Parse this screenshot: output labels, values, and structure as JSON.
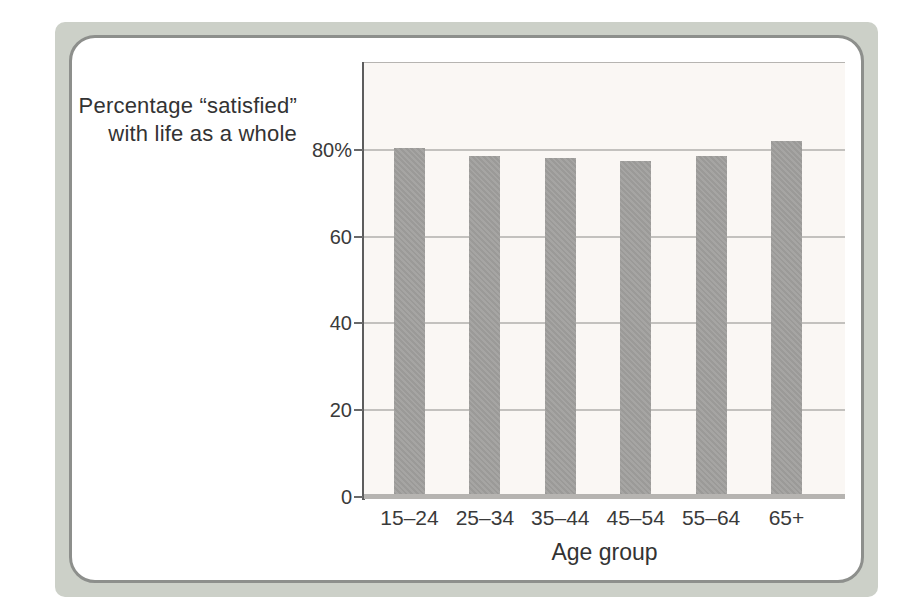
{
  "frame": {
    "outer_band_color": "#ccd0c8",
    "border_color": "#8d8f8c",
    "panel_color": "#ffffff"
  },
  "chart_data": {
    "type": "bar",
    "title_lines": [
      "Percentage “satisfied”",
      "with life as a whole"
    ],
    "categories": [
      "15–24",
      "25–34",
      "35–44",
      "45–54",
      "55–64",
      "65+"
    ],
    "values": [
      80.5,
      78.5,
      78,
      77.5,
      78.5,
      82
    ],
    "xlabel": "Age group",
    "ylabel": "",
    "ylim": [
      0,
      100
    ],
    "yticks": [
      {
        "value": 80,
        "label": "80%"
      },
      {
        "value": 60,
        "label": "60"
      },
      {
        "value": 40,
        "label": "40"
      },
      {
        "value": 20,
        "label": "20"
      },
      {
        "value": 0,
        "label": "0"
      }
    ],
    "grid": true,
    "legend": "none",
    "bar_color": "#a1a09e",
    "plot_background": "#faf7f4",
    "gridline_color": "#c3c1be",
    "axis_color": "#5d5d5d",
    "baseline_color": "#b6b4b1",
    "text_color": "#3a3a3a"
  }
}
